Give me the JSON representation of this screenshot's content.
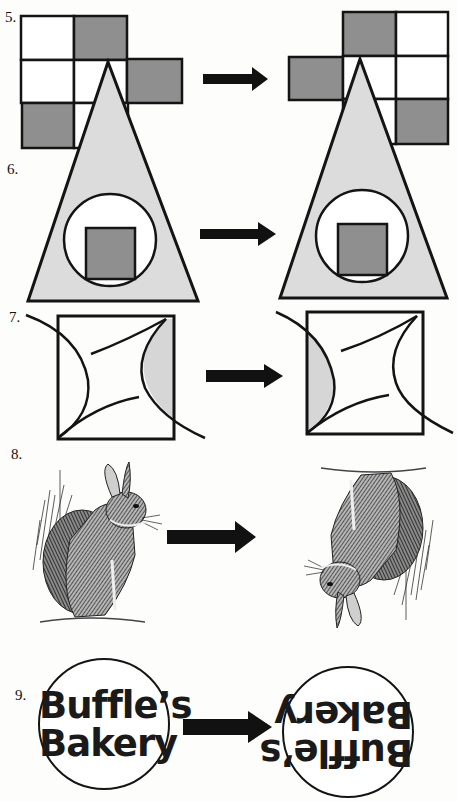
{
  "header": {
    "partial_title": "...mple"
  },
  "colors": {
    "shade_dark": "#8f8f8f",
    "shade_light": "#d6d6d6",
    "stroke": "#141414",
    "paper": "#fdfdfb"
  },
  "problems": [
    {
      "number": "5.",
      "type": "grid",
      "transform": "reflection",
      "before": {
        "rows": [
          [
            "white",
            "gray"
          ],
          [
            "white",
            "white",
            "gray"
          ],
          [
            "gray",
            "white"
          ]
        ]
      },
      "after": {
        "rows": [
          [
            "gray",
            "white"
          ],
          [
            "gray",
            "white",
            "white"
          ],
          [
            "white",
            "gray"
          ]
        ]
      }
    },
    {
      "number": "6.",
      "type": "triangle-circle-square",
      "transform": "none-apparent"
    },
    {
      "number": "7.",
      "type": "square-with-arcs",
      "transform": "reflection",
      "before": {
        "shaded_side": "right"
      },
      "after": {
        "shaded_side": "left"
      }
    },
    {
      "number": "8.",
      "type": "rabbit-engraving",
      "transform": "rotation-180"
    },
    {
      "number": "9.",
      "type": "sign",
      "transform": "rotation-180",
      "text_line1": "Buffle’s",
      "text_line2": "Bakery"
    }
  ],
  "arrow_icon": "right-arrow"
}
